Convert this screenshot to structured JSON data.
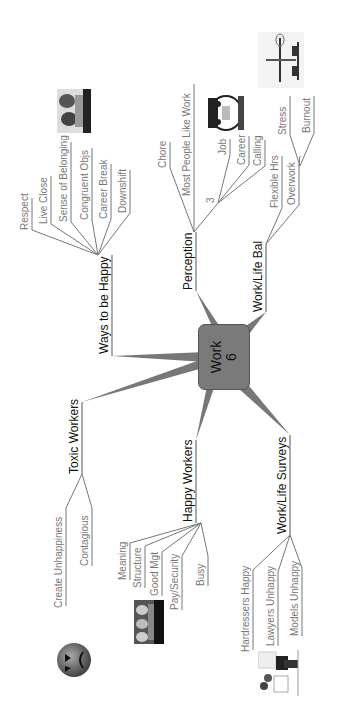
{
  "center": {
    "title": "Work",
    "count": "6"
  },
  "branches": {
    "ways": {
      "label": "Ways to be Happy",
      "children": [
        "Respect",
        "Live Close",
        "Sense of Belonging",
        "Congruent Objs",
        "Career Break",
        "Downshift"
      ]
    },
    "perception": {
      "label": "Perception",
      "children": [
        "Chore",
        "Most People Like Work",
        "3"
      ],
      "sub3": [
        "Job",
        "Career",
        "Calling"
      ]
    },
    "worklife": {
      "label": "Work/Life Bal",
      "children": [
        "Flexible Hrs",
        "Overwork"
      ],
      "overwork": [
        "Stress",
        "Burnout"
      ]
    },
    "toxic": {
      "label": "Toxic Workers",
      "children": [
        "Create Unhappiness",
        "Contagious"
      ]
    },
    "happy": {
      "label": "Happy Workers",
      "children": [
        "Meaning",
        "Structure",
        "Good Mgt",
        "Pay/Security",
        "Busy"
      ]
    },
    "surveys": {
      "label": "Work/Life Surveys",
      "children": [
        "Hardressers Happy",
        "Lawyers Unhappy",
        "Models Unhappy"
      ]
    }
  },
  "images": [
    "couple-photo",
    "cartoon-face",
    "balance-scale",
    "angry-face",
    "group-photo",
    "office-clipart"
  ],
  "colors": {
    "center": "#7a7a7a",
    "branch": "#777777",
    "line": "#888888"
  }
}
